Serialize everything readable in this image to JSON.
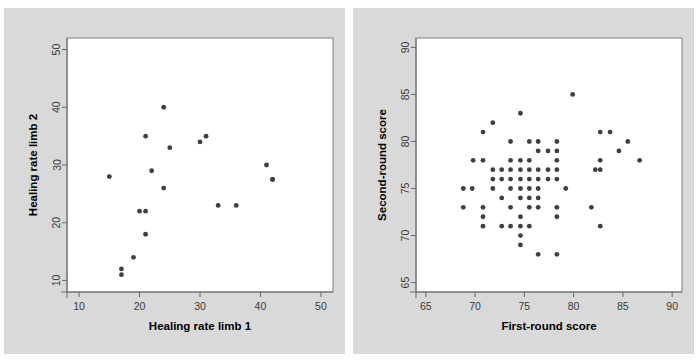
{
  "figure": {
    "background_color": "#ffffff",
    "panel_color": "#d9d9d9",
    "plot_area_color": "#ffffff",
    "marker_color": "#3f3f42",
    "axis_color": "#6f6f6f"
  },
  "chart_data": [
    {
      "type": "scatter",
      "panel": "left",
      "title": "",
      "xlabel": "Healing rate limb 1",
      "ylabel": "Healing rate limb 2",
      "xlim": [
        8,
        52
      ],
      "ylim": [
        8,
        52
      ],
      "xticks": [
        10,
        20,
        30,
        40,
        50
      ],
      "yticks": [
        10,
        20,
        30,
        40,
        50
      ],
      "xticklabels": [
        "10",
        "20",
        "30",
        "40",
        "50"
      ],
      "yticklabels": [
        "10",
        "20",
        "30",
        "40",
        "50"
      ],
      "grid": false,
      "legend": "none",
      "n_points": 19,
      "points": [
        [
          15,
          28
        ],
        [
          17,
          12
        ],
        [
          17,
          11
        ],
        [
          19,
          14
        ],
        [
          20,
          22
        ],
        [
          21,
          22
        ],
        [
          21,
          18
        ],
        [
          21,
          35
        ],
        [
          22,
          29
        ],
        [
          24,
          40
        ],
        [
          24,
          26
        ],
        [
          25,
          33
        ],
        [
          30,
          34
        ],
        [
          31,
          35
        ],
        [
          33,
          23
        ],
        [
          36,
          23
        ],
        [
          41,
          30
        ],
        [
          42,
          27.5
        ],
        [
          42,
          27.5
        ]
      ]
    },
    {
      "type": "scatter",
      "panel": "right",
      "title": "",
      "xlabel": "First-round score",
      "ylabel": "Second-round score",
      "xlim": [
        64,
        91
      ],
      "ylim": [
        64,
        91
      ],
      "xticks": [
        65,
        70,
        75,
        80,
        85,
        90
      ],
      "yticks": [
        65,
        70,
        75,
        80,
        85,
        90
      ],
      "xticklabels": [
        "65",
        "70",
        "75",
        "80",
        "85",
        "90"
      ],
      "yticklabels": [
        "65",
        "70",
        "75",
        "80",
        "85",
        "90"
      ],
      "grid": false,
      "legend": "none",
      "n_points": 97,
      "points": [
        [
          68.8,
          75
        ],
        [
          68.8,
          73
        ],
        [
          69.7,
          75
        ],
        [
          69.8,
          78
        ],
        [
          70.8,
          78
        ],
        [
          70.8,
          81
        ],
        [
          70.8,
          73
        ],
        [
          70.8,
          72
        ],
        [
          70.8,
          71
        ],
        [
          71.8,
          82
        ],
        [
          71.8,
          77
        ],
        [
          71.8,
          76
        ],
        [
          71.8,
          75
        ],
        [
          72.7,
          77
        ],
        [
          72.7,
          76
        ],
        [
          72.7,
          74
        ],
        [
          72.7,
          71
        ],
        [
          73.6,
          80
        ],
        [
          73.6,
          78
        ],
        [
          73.6,
          77
        ],
        [
          73.6,
          76
        ],
        [
          73.6,
          75
        ],
        [
          73.6,
          73
        ],
        [
          73.6,
          71
        ],
        [
          74.6,
          83
        ],
        [
          74.6,
          78
        ],
        [
          74.6,
          77
        ],
        [
          74.6,
          76
        ],
        [
          74.6,
          75
        ],
        [
          74.6,
          74
        ],
        [
          74.6,
          72
        ],
        [
          74.6,
          71
        ],
        [
          74.6,
          70
        ],
        [
          74.6,
          69
        ],
        [
          75.5,
          80
        ],
        [
          75.5,
          78
        ],
        [
          75.5,
          77
        ],
        [
          75.5,
          76
        ],
        [
          75.5,
          75
        ],
        [
          75.5,
          74
        ],
        [
          75.5,
          73
        ],
        [
          75.5,
          71
        ],
        [
          76.4,
          80
        ],
        [
          76.4,
          79
        ],
        [
          76.4,
          77
        ],
        [
          76.4,
          76
        ],
        [
          76.4,
          75
        ],
        [
          76.4,
          74
        ],
        [
          76.4,
          73
        ],
        [
          76.4,
          68
        ],
        [
          77.4,
          79
        ],
        [
          77.4,
          77
        ],
        [
          77.4,
          76
        ],
        [
          78.3,
          80
        ],
        [
          78.3,
          79
        ],
        [
          78.3,
          78
        ],
        [
          78.3,
          77
        ],
        [
          78.3,
          76
        ],
        [
          78.3,
          73
        ],
        [
          78.3,
          72
        ],
        [
          78.3,
          68
        ],
        [
          79.2,
          75
        ],
        [
          79.9,
          85
        ],
        [
          81.8,
          73
        ],
        [
          82.2,
          77
        ],
        [
          82.7,
          81
        ],
        [
          82.7,
          78
        ],
        [
          82.7,
          77
        ],
        [
          82.7,
          71
        ],
        [
          83.7,
          81
        ],
        [
          84.6,
          79
        ],
        [
          85.5,
          80
        ],
        [
          86.7,
          78
        ]
      ]
    }
  ]
}
